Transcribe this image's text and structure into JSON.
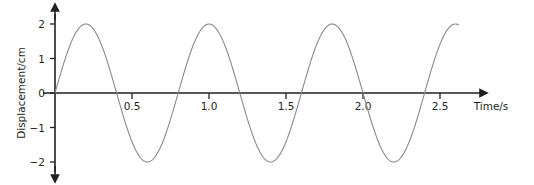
{
  "chart_data": {
    "type": "line",
    "title": "",
    "subtitle": "",
    "xlabel": "Time/s",
    "ylabel": "Displacement/cm",
    "xlim": [
      -0.06,
      2.78
    ],
    "ylim": [
      -2.35,
      2.35
    ],
    "grid": false,
    "legend": null,
    "annotations": [],
    "x_ticks": [
      {
        "value": 0.5,
        "label": "0.5"
      },
      {
        "value": 1.0,
        "label": "1.0"
      },
      {
        "value": 1.5,
        "label": "1.5"
      },
      {
        "value": 2.0,
        "label": "2.0"
      },
      {
        "value": 2.5,
        "label": "2.5"
      }
    ],
    "y_ticks": [
      {
        "value": 2,
        "label": "2"
      },
      {
        "value": 1,
        "label": "1"
      },
      {
        "value": 0,
        "label": "0"
      },
      {
        "value": -1,
        "label": "−1"
      },
      {
        "value": -2,
        "label": "−2"
      }
    ],
    "waveform": {
      "function": "sine",
      "amplitude": 2,
      "period": 0.8,
      "frequency": 1.25,
      "phase": 0,
      "x_start": 0,
      "x_end": 2.62,
      "units_x": "s",
      "units_y": "cm",
      "peaks_x": [
        0.2,
        1.0,
        1.8,
        2.6
      ],
      "peaks_y": [
        2,
        2,
        2,
        2
      ],
      "troughs_x": [
        0.6,
        1.4,
        2.2
      ],
      "troughs_y": [
        -2,
        -2,
        -2
      ],
      "zero_crossings_x": [
        0,
        0.4,
        0.8,
        1.2,
        1.6,
        2.0,
        2.4
      ]
    },
    "series": [
      {
        "name": "displacement",
        "color": "#8a8a8a",
        "line_width": 1.1,
        "x": [
          0,
          0.05,
          0.1,
          0.15,
          0.2,
          0.25,
          0.3,
          0.35,
          0.4,
          0.45,
          0.5,
          0.55,
          0.6,
          0.65,
          0.7,
          0.75,
          0.8,
          0.85,
          0.9,
          0.95,
          1.0,
          1.05,
          1.1,
          1.15,
          1.2,
          1.25,
          1.3,
          1.35,
          1.4,
          1.45,
          1.5,
          1.55,
          1.6,
          1.65,
          1.7,
          1.75,
          1.8,
          1.85,
          1.9,
          1.95,
          2.0,
          2.05,
          2.1,
          2.15,
          2.2,
          2.25,
          2.3,
          2.35,
          2.4,
          2.45,
          2.5,
          2.55,
          2.6,
          2.62
        ],
        "y": [
          0,
          0.765,
          1.414,
          1.848,
          2,
          1.848,
          1.414,
          0.765,
          0,
          -0.765,
          -1.414,
          -1.848,
          -2,
          -1.848,
          -1.414,
          -0.765,
          0,
          0.765,
          1.414,
          1.848,
          2,
          1.848,
          1.414,
          0.765,
          0,
          -0.765,
          -1.414,
          -1.848,
          -2,
          -1.848,
          -1.414,
          -0.765,
          0,
          0.765,
          1.414,
          1.848,
          2,
          1.848,
          1.414,
          0.765,
          0,
          -0.765,
          -1.414,
          -1.848,
          -2,
          -1.848,
          -1.414,
          -0.765,
          0,
          0.765,
          1.414,
          1.848,
          2,
          1.995
        ]
      }
    ],
    "colors": {
      "curve": "#8a8a8a",
      "axis": "#231f20",
      "tick_text": "#231f20",
      "background": "#ffffff"
    }
  },
  "axes": {
    "x_axis_label": "Time/s",
    "y_axis_label": "Displacement/cm",
    "x_tick_labels": [
      "0.5",
      "1.0",
      "1.5",
      "2.0",
      "2.5"
    ],
    "y_tick_labels": [
      "2",
      "1",
      "0",
      "−1",
      "−2"
    ]
  }
}
